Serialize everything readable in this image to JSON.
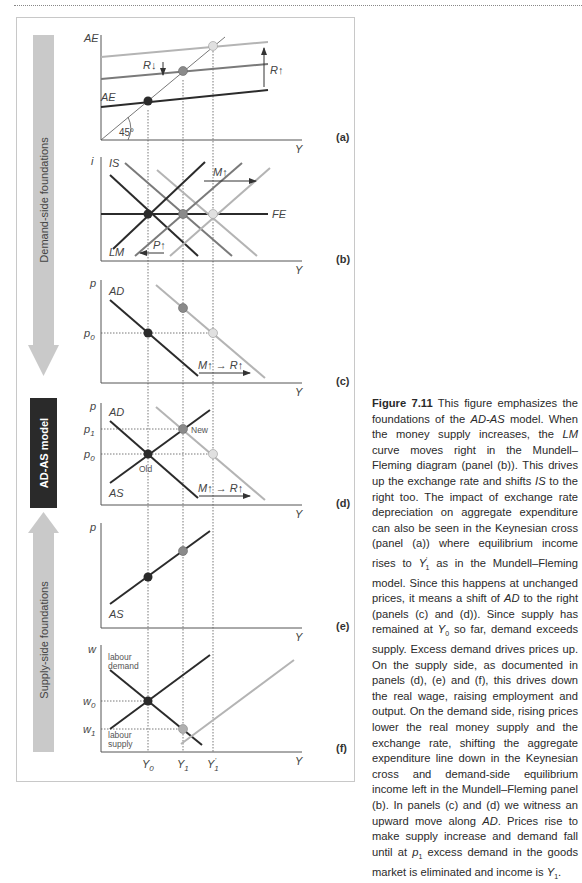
{
  "figure": {
    "sidebar": {
      "demand_label": "Demand-side foundations",
      "model_label": "AD-AS model",
      "supply_label": "Supply-side foundations"
    },
    "colors": {
      "old": "#2b2b2b",
      "mid": "#7a7a7a",
      "new": "#b4b4b4",
      "arrow_fill": "#c9c9c9",
      "model_box": "#2a2a2a",
      "frame": "#c8c8c8"
    },
    "x_ticks": {
      "y0": "Y",
      "y0_sub": "0",
      "y1": "Y",
      "y1_sub": "1",
      "y1p": "Y",
      "y1p_sub": "1",
      "y1p_prime": "'"
    },
    "panels": {
      "a": {
        "tag": "(a)",
        "y_axis": "AE",
        "x_axis": "Y",
        "curve_label": "AE",
        "angle_label": "45°",
        "shift_down": "R↓",
        "shift_up": "R↑"
      },
      "b": {
        "tag": "(b)",
        "y_axis": "i",
        "x_axis": "Y",
        "is_label": "IS",
        "lm_label": "LM",
        "fe_label": "FE",
        "shift_right": "M↑",
        "shift_left": "P↑"
      },
      "c": {
        "tag": "(c)",
        "y_axis": "p",
        "x_axis": "Y",
        "curve_label": "AD",
        "p0": "p",
        "p0_sub": "0",
        "shift": "M↑ → R↑"
      },
      "d": {
        "tag": "(d)",
        "y_axis": "p",
        "x_axis": "Y",
        "ad_label": "AD",
        "as_label": "AS",
        "p1": "p",
        "p1_sub": "1",
        "p0": "p",
        "p0_sub": "0",
        "old_label": "Old",
        "new_label": "New",
        "shift": "M↑ → R↑"
      },
      "e": {
        "tag": "(e)",
        "y_axis": "p",
        "x_axis": "Y",
        "curve_label": "AS"
      },
      "f": {
        "tag": "(f)",
        "y_axis": "w",
        "x_axis": "Y",
        "demand_label_1": "labour",
        "demand_label_2": "demand",
        "supply_label_1": "labour",
        "supply_label_2": "supply",
        "w0": "w",
        "w0_sub": "0",
        "w1": "w",
        "w1_sub": "1"
      }
    }
  },
  "caption": {
    "figure_number": "Figure 7.11",
    "segments": [
      " This figure emphasizes the foundations of the ",
      "AD-AS",
      " model. When the money supply increases, the ",
      "LM",
      " curve moves right in the Mundell–Fleming diagram (panel (b)). This drives up the exchange rate and shifts ",
      "IS",
      " to the right too. The impact of exchange rate depreciation on aggregate expenditure can also be seen in the Keynesian cross (panel (a)) where equilibrium income rises to ",
      "Y",
      "'",
      "1",
      " as in the Mundell–Fleming model. Since this happens at unchanged prices, it means a shift of ",
      "AD",
      " to the right (panels (c) and (d)). Since supply has remained at ",
      "Y",
      "0",
      " so far, demand exceeds supply. Excess demand drives prices up. On the supply side, as documented in panels (d), (e) and (f), this drives down the real wage, raising employment and output. On the demand side, rising prices lower the real money supply and the exchange rate, shifting the aggregate expenditure line down in the Keynesian cross and demand-side equilibrium income left in the Mundell–Fleming panel (b). In panels (c) and (d) we witness an upward move along ",
      "AD",
      ". Prices rise to make supply increase and demand fall until at ",
      "p",
      "1",
      " excess demand in the goods market is eliminated and income is ",
      "Y",
      "1",
      "."
    ]
  }
}
